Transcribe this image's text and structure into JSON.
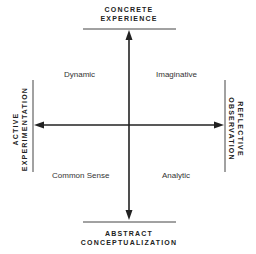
{
  "diagram": {
    "poles": {
      "top": {
        "line1": "CONCRETE",
        "line2": "EXPERIENCE"
      },
      "bottom": {
        "line1": "ABSTRACT",
        "line2": "CONCEPTUALIZATION"
      },
      "left": {
        "line1": "ACTIVE",
        "line2": "EXPERIMENTATION"
      },
      "right": {
        "line1": "REFLECTIVE",
        "line2": "OBSERVATION"
      }
    },
    "quadrants": {
      "top_left": "Dynamic",
      "top_right": "Imaginative",
      "bottom_left": "Common Sense",
      "bottom_right": "Analytic"
    },
    "colors": {
      "axis": "#222222",
      "text": "#222222",
      "background": "#ffffff"
    }
  }
}
